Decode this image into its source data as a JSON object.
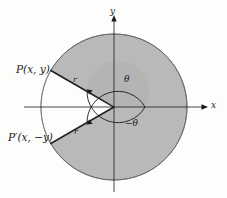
{
  "figure": {
    "colors": {
      "background": "#fdfdfc",
      "shaded_region": "#b9b9b9",
      "shaded_region_inner": "#b0b0b0",
      "stroke": "#222222",
      "axis": "#1a1a1a",
      "circle_outline": "#555555"
    },
    "axes": {
      "y_label": "y",
      "x_label": "x",
      "origin": {
        "x": 114,
        "y": 107
      }
    },
    "labels": {
      "point_p": "P(x, y)",
      "point_p_reflected": "P′(x, −y)",
      "radius_upper": "r",
      "radius_lower": "r",
      "angle_upper": "θ",
      "angle_lower": "−θ"
    },
    "geometry": {
      "circle_radius": 73,
      "inner_arc_radius": 31,
      "angle_upper_deg": 150,
      "angle_lower_deg": -150,
      "wedge_description": "white sector between ray to P and ray to P' passing through 180 degrees"
    }
  }
}
